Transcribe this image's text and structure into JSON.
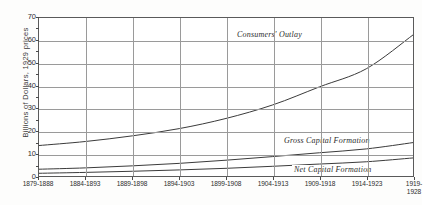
{
  "chart_data": {
    "type": "line",
    "title": "",
    "xlabel": "",
    "ylabel": "Billions of Dollars, 1929 prices",
    "ylim": [
      0,
      70
    ],
    "yticks": [
      0,
      10,
      20,
      30,
      40,
      50,
      60,
      70
    ],
    "yminor_step": 5,
    "grid": true,
    "legend_position": "inline-annotations",
    "categories": [
      "1879-1888",
      "1884-1893",
      "1889-1898",
      "1894-1903",
      "1899-1908",
      "1904-1913",
      "1909-1918",
      "1914-1923",
      "1919-\n1928"
    ],
    "xtick_labels_display": [
      "1879-1888",
      "1884-1893",
      "1889-1898",
      "1894-1903",
      "1899-1908",
      "1904-1913",
      "1909-1918",
      "1914-1923",
      "1919-\n1928"
    ],
    "series": [
      {
        "name": "Consumers' Outlay",
        "values": [
          13.5,
          15.3,
          17.8,
          21.0,
          25.5,
          31.5,
          39.5,
          47.5,
          62.5
        ]
      },
      {
        "name": "Gross Capital Formation",
        "values": [
          3.0,
          3.6,
          4.5,
          5.6,
          7.0,
          8.6,
          10.3,
          12.0,
          14.8
        ]
      },
      {
        "name": "Net Capital Formation",
        "values": [
          1.2,
          1.6,
          2.1,
          2.7,
          3.4,
          4.3,
          5.3,
          6.3,
          8.0
        ]
      }
    ],
    "annotations": [
      {
        "text": "Consumers' Outlay",
        "series": "Consumers' Outlay"
      },
      {
        "text": "Gross Capital Formation",
        "series": "Gross Capital Formation"
      },
      {
        "text": "Net Capital Formation",
        "series": "Net Capital Formation"
      }
    ],
    "colors": {
      "line": "#3b3b3b",
      "grid": "#9a9a9a",
      "frame": "#5a5a5a",
      "background": "#ffffff",
      "text": "#2e2e2e"
    }
  },
  "axis": {
    "y_title": "Billions of Dollars, 1929 prices",
    "y_tick_labels": [
      "0",
      "10",
      "20",
      "30",
      "40",
      "50",
      "60",
      "70"
    ]
  }
}
